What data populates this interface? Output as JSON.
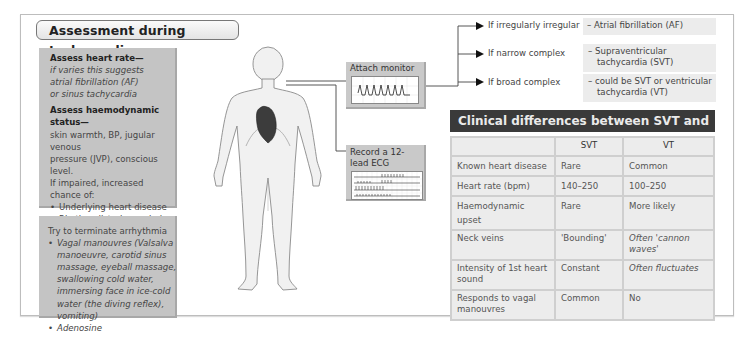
{
  "title": "Assessment during tachycardia",
  "assess_box": {
    "heart_rate_heading": "Assess heart rate—",
    "heart_rate_text": [
      "if varies this suggests",
      "atrial fibrillation (AF)",
      "or sinus tachycardia"
    ],
    "haemo_heading": "Assess haemodynamic status—",
    "haemo_text": [
      "skin warmth, BP, jugular venous",
      "pressure (JVP), conscious level.",
      "If impaired, increased chance of:"
    ],
    "haemo_bullets": [
      "Underlying heart disease",
      "Rhythm disturbance being VT"
    ],
    "thyro_heading": "Assess for thyrotoxicosis"
  },
  "terminate_box": {
    "heading": "Try to terminate arrhythmia",
    "bullets": [
      "Vagal manouvres (Valsalva manoeuvre, carotid sinus massage, eyeball massage, swallowing cold water, immersing face in ice-cold water (the diving reflex), vomiting)",
      "Adenosine"
    ]
  },
  "monitor": {
    "label": "Attach monitor"
  },
  "ecg": {
    "label": "Record a 12-lead ECG"
  },
  "flow": [
    {
      "condition": "If irregularly irregular",
      "result": "– Atrial fibrillation (AF)"
    },
    {
      "condition": "If narrow complex",
      "result": "– Supraventricular tachycardia (SVT)"
    },
    {
      "condition": "If broad complex",
      "result": "– could be SVT or ventricular tachycardia (VT)"
    }
  ],
  "clinical": {
    "title": "Clinical differences between SVT and VT",
    "columns": [
      "",
      "SVT",
      "VT"
    ],
    "rows": [
      [
        "Known heart disease",
        "Rare",
        "Common"
      ],
      [
        "Heart rate (bpm)",
        "140–250",
        "100–250"
      ],
      [
        "Haemodynamic upset",
        "Rare",
        "More likely"
      ],
      [
        "Neck veins",
        "'Bounding'",
        "Often 'cannon waves'"
      ],
      [
        "Intensity of 1st heart sound",
        "Constant",
        "Often fluctuates"
      ],
      [
        "Responds to vagal manouvres",
        "Common",
        "No"
      ]
    ]
  },
  "colors": {
    "box_gray": "#c4c4c4",
    "header_dark": "#3a3a3a",
    "cell_light": "#ececec",
    "heart": "#3c3c3c"
  }
}
